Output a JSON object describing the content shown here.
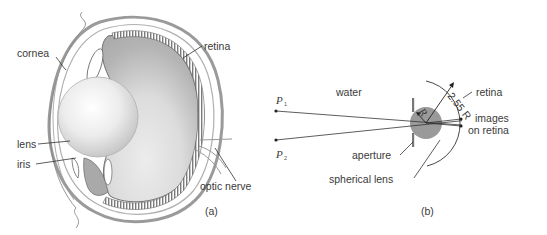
{
  "figure_a": {
    "caption": "(a)",
    "labels": {
      "cornea": "cornea",
      "retina": "retina",
      "lens": "lens",
      "iris": "iris",
      "optic_nerve": "optic nerve"
    }
  },
  "figure_b": {
    "caption": "(b)",
    "labels": {
      "water": "water",
      "p1": "P",
      "p1_sub": "1",
      "p2": "P",
      "p2_sub": "2",
      "retina": "retina",
      "images_line1": "images",
      "images_line2": "on retina",
      "aperture": "aperture",
      "spherical_lens": "spherical lens",
      "radius": "R",
      "retina_radius": "2.55 R"
    }
  },
  "colors": {
    "line": "#333333",
    "eye_gray": "#9a9a9a",
    "vitreous": "#b5b5b5",
    "lens_sphere": "#8f8f8f",
    "text": "#3a3a3a"
  }
}
